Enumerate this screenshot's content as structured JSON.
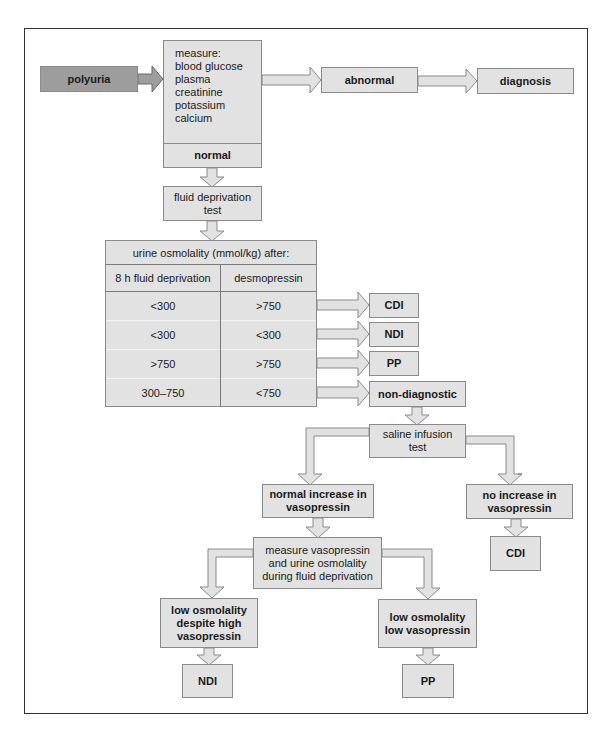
{
  "diagram": {
    "type": "flowchart",
    "colors": {
      "box_fill": "#e2e2e2",
      "box_border": "#8a8a8a",
      "start_fill": "#9d9d9d",
      "frame_border": "#333333"
    },
    "nodes": {
      "polyuria": "polyuria",
      "measure": [
        "measure:",
        "blood glucose",
        "plasma",
        "creatinine",
        "potassium",
        "calcium"
      ],
      "abnormal": "abnormal",
      "diagnosis": "diagnosis",
      "normal": "normal",
      "fluid_deprivation": [
        "fluid deprivation",
        "test"
      ],
      "cdi_1": "CDI",
      "ndi_1": "NDI",
      "pp_1": "PP",
      "non_diagnostic": "non-diagnostic",
      "saline": [
        "saline infusion",
        "test"
      ],
      "normal_increase": [
        "normal increase in",
        "vasopressin"
      ],
      "no_increase": [
        "no increase in",
        "vasopressin"
      ],
      "cdi_2": "CDI",
      "measure_vaso": [
        "measure vasopressin",
        "and urine osmolality",
        "during fluid deprivation"
      ],
      "low_osm_high": [
        "low osmolality",
        "despite high",
        "vasopressin"
      ],
      "low_osm_low": [
        "low osmolality",
        "low vasopressin"
      ],
      "ndi_2": "NDI",
      "pp_2": "PP"
    },
    "table": {
      "header": "urine osmolality (mmol/kg) after:",
      "columns": [
        "8 h fluid deprivation",
        "desmopressin"
      ],
      "rows": [
        [
          "<300",
          ">750"
        ],
        [
          "<300",
          "<300"
        ],
        [
          ">750",
          ">750"
        ],
        [
          "300–750",
          "<750"
        ]
      ]
    },
    "edges": [
      [
        "polyuria",
        "measure"
      ],
      [
        "measure",
        "abnormal"
      ],
      [
        "abnormal",
        "diagnosis"
      ],
      [
        "measure",
        "normal"
      ],
      [
        "normal",
        "fluid_deprivation"
      ],
      [
        "fluid_deprivation",
        "table"
      ],
      [
        "table.row0",
        "cdi_1"
      ],
      [
        "table.row1",
        "ndi_1"
      ],
      [
        "table.row2",
        "pp_1"
      ],
      [
        "table.row3",
        "non_diagnostic"
      ],
      [
        "non_diagnostic",
        "saline"
      ],
      [
        "saline",
        "normal_increase"
      ],
      [
        "saline",
        "no_increase"
      ],
      [
        "no_increase",
        "cdi_2"
      ],
      [
        "normal_increase",
        "measure_vaso"
      ],
      [
        "measure_vaso",
        "low_osm_high"
      ],
      [
        "measure_vaso",
        "low_osm_low"
      ],
      [
        "low_osm_high",
        "ndi_2"
      ],
      [
        "low_osm_low",
        "pp_2"
      ]
    ]
  }
}
